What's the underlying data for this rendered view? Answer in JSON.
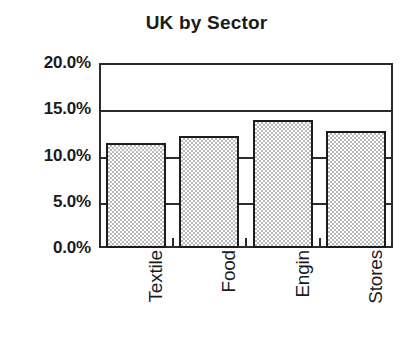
{
  "chart_data": {
    "type": "bar",
    "title": "UK by Sector",
    "xlabel": "",
    "ylabel": "",
    "categories": [
      "Textile",
      "Food",
      "Engin",
      "Stores"
    ],
    "values": [
      11.3,
      12.1,
      13.8,
      12.7
    ],
    "value_labels": [
      "11.3%",
      "12.1%",
      "13.8%",
      "12.7%"
    ],
    "ylim": [
      0.0,
      20.0
    ],
    "ytick_values": [
      20.0,
      15.0,
      10.0,
      5.0,
      0.0
    ],
    "ytick_labels": [
      "20.0%",
      "15.0%",
      "10.0%",
      "5.0%",
      "0.0%"
    ],
    "grid": "horizontal",
    "legend": "none",
    "series": [
      {
        "name": "UK by Sector",
        "values": [
          11.3,
          12.1,
          13.8,
          12.7
        ]
      }
    ],
    "colors": {
      "bar_fill": "#c8c8c8",
      "bar_border": "#1c1c1c",
      "axis": "#2b2b2b",
      "text": "#1b1b1b",
      "background": "#ffffff"
    }
  },
  "axis": {
    "y_labels": [
      {
        "text": "20.0%",
        "value": 20.0
      },
      {
        "text": "15.0%",
        "value": 15.0
      },
      {
        "text": "10.0%",
        "value": 10.0
      },
      {
        "text": "5.0%",
        "value": 5.0
      },
      {
        "text": "0.0%",
        "value": 0.0
      }
    ],
    "x_labels": [
      "Textile",
      "Food",
      "Engin",
      "Stores"
    ]
  }
}
